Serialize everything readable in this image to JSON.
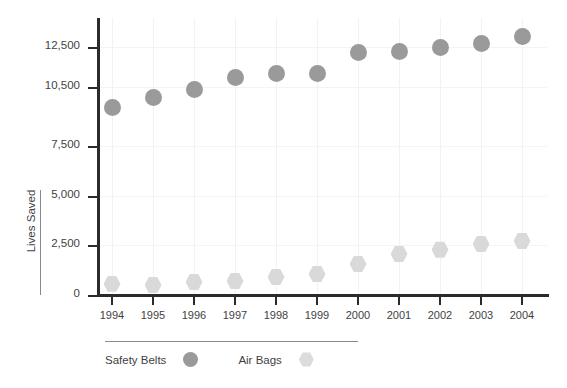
{
  "chart_data": {
    "type": "scatter",
    "title": "",
    "xlabel": "",
    "ylabel": "Lives Saved",
    "categories": [
      "1994",
      "1995",
      "1996",
      "1997",
      "1998",
      "1999",
      "2000",
      "2001",
      "2002",
      "2003",
      "2004"
    ],
    "series": [
      {
        "name": "Safety Belts",
        "color": "#9a9a9a",
        "marker": "circle",
        "values": [
          9450,
          9950,
          10350,
          10950,
          11150,
          11150,
          12200,
          12250,
          12500,
          12700,
          13050
        ]
      },
      {
        "name": "Air Bags",
        "color": "#d9d9d9",
        "marker": "hexagon",
        "values": [
          560,
          505,
          655,
          705,
          910,
          1060,
          1565,
          2070,
          2275,
          2575,
          2725
        ]
      }
    ],
    "ytick_labels": [
      "0",
      "2,500",
      "5,000",
      "7,500",
      "10,500",
      "12,500"
    ],
    "ytick_values": [
      0,
      2500,
      5000,
      7500,
      10500,
      12500
    ],
    "ylim": [
      0,
      13750
    ],
    "grid": true,
    "legend_position": "bottom-left"
  },
  "axis": {
    "y_title": "Lives Saved"
  },
  "legend": {
    "entries": [
      {
        "label": "Safety Belts"
      },
      {
        "label": "Air Bags"
      }
    ]
  },
  "title_sliver": ""
}
